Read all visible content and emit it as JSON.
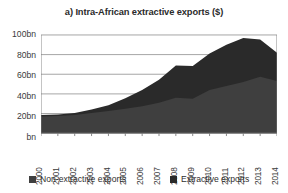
{
  "chart_data": {
    "type": "area",
    "title": "a) Intra-African extractive exports ($)",
    "xlabel": "",
    "ylabel": "",
    "stacked": true,
    "grid": true,
    "legend_position": "bottom",
    "ylim": [
      0,
      100
    ],
    "yticks": [
      0,
      20,
      40,
      60,
      80,
      100
    ],
    "ytick_labels": [
      "bn",
      "20bn",
      "40bn",
      "60bn",
      "80bn",
      "100bn"
    ],
    "categories": [
      "2000",
      "2001",
      "2002",
      "2003",
      "2004",
      "2005",
      "2006",
      "2007",
      "2008",
      "2009",
      "2010",
      "2011",
      "2012",
      "2013",
      "2014"
    ],
    "series": [
      {
        "name": "Non-extractive exports",
        "color": "#3f3f3f",
        "values": [
          17,
          17.5,
          18.5,
          20.5,
          22.5,
          25,
          27.5,
          31,
          36,
          35,
          44,
          48,
          52,
          57.5,
          53
        ]
      },
      {
        "name": "Extractive exports",
        "color": "#2a2a2a",
        "values": [
          1.5,
          1.5,
          2,
          3.5,
          6,
          10.5,
          16.5,
          23.5,
          33,
          33.5,
          37,
          42,
          45,
          38,
          29
        ]
      }
    ],
    "totals": [
      18.5,
      19,
      20.5,
      24,
      28.5,
      35.5,
      44,
      54.5,
      69,
      68.5,
      81,
      90,
      97,
      95.5,
      82
    ]
  },
  "legend": {
    "items": [
      {
        "label": "Non-extractive exports",
        "color": "#3f3f3f"
      },
      {
        "label": "Extractive exports",
        "color": "#2a2a2a"
      }
    ]
  },
  "colors": {
    "background": "#ffffff",
    "gridline": "#9a9a9a",
    "axis": "#7a7a7a",
    "text": "#3a3a3a",
    "title_text": "#2b2b2b"
  }
}
